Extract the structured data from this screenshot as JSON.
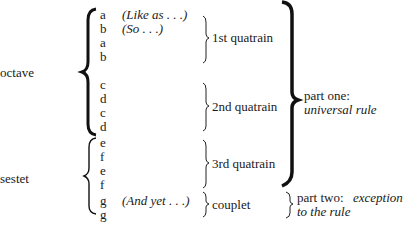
{
  "sections": {
    "octave_label": "octave",
    "sestet_label": "sestet"
  },
  "lines": [
    {
      "rhyme": "a",
      "note": "(Like as . . .)"
    },
    {
      "rhyme": "b",
      "note": "(So . . .)"
    },
    {
      "rhyme": "a",
      "note": ""
    },
    {
      "rhyme": "b",
      "note": ""
    },
    {
      "rhyme": "c",
      "note": ""
    },
    {
      "rhyme": "d",
      "note": ""
    },
    {
      "rhyme": "c",
      "note": ""
    },
    {
      "rhyme": "d",
      "note": ""
    },
    {
      "rhyme": "e",
      "note": ""
    },
    {
      "rhyme": "f",
      "note": ""
    },
    {
      "rhyme": "e",
      "note": ""
    },
    {
      "rhyme": "f",
      "note": ""
    },
    {
      "rhyme": "g",
      "note": "(And yet . . .)"
    },
    {
      "rhyme": "g",
      "note": ""
    }
  ],
  "groups": {
    "q1": "1st quatrain",
    "q2": "2nd quatrain",
    "q3": "3rd quatrain",
    "couplet": "couplet"
  },
  "parts": {
    "one_label": "part one:",
    "one_desc": "universal rule",
    "two_label": "part two:",
    "two_desc_1": "exception",
    "two_desc_2": "to the rule"
  }
}
